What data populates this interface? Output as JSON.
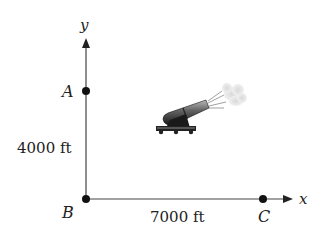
{
  "diagram": {
    "axes": {
      "x_label": "x",
      "y_label": "y"
    },
    "points": [
      {
        "id": "A",
        "label": "A"
      },
      {
        "id": "B",
        "label": "B"
      },
      {
        "id": "C",
        "label": "C"
      }
    ],
    "dimensions": {
      "vertical": "4000 ft",
      "horizontal": "7000 ft"
    },
    "illustration": "cannon firing"
  }
}
